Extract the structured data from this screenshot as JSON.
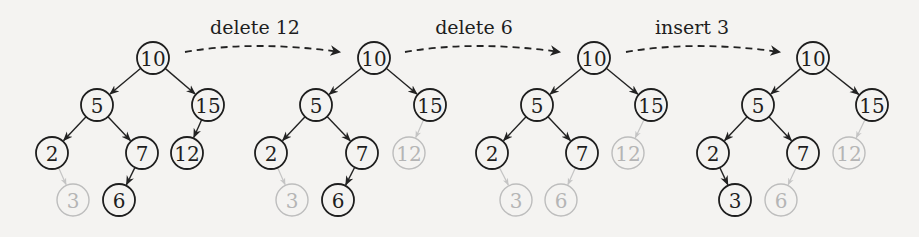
{
  "colors": {
    "active": "#1e1e1e",
    "ghost": "#bdbdbd",
    "background": "#f4f3f1"
  },
  "transitions": [
    {
      "label": "delete 12"
    },
    {
      "label": "delete 6"
    },
    {
      "label": "insert 3"
    }
  ],
  "trees": [
    {
      "name": "initial",
      "nodes": [
        {
          "key": "10",
          "x": 153,
          "y": 58,
          "state": "active"
        },
        {
          "key": "5",
          "x": 97,
          "y": 105,
          "state": "active"
        },
        {
          "key": "15",
          "x": 208,
          "y": 105,
          "state": "active"
        },
        {
          "key": "2",
          "x": 52,
          "y": 153,
          "state": "active"
        },
        {
          "key": "7",
          "x": 142,
          "y": 153,
          "state": "active"
        },
        {
          "key": "12",
          "x": 187,
          "y": 153,
          "state": "active"
        },
        {
          "key": "3",
          "x": 73,
          "y": 200,
          "state": "ghost"
        },
        {
          "key": "6",
          "x": 119,
          "y": 200,
          "state": "active"
        }
      ]
    },
    {
      "name": "after-delete-12",
      "nodes": [
        {
          "key": "10",
          "x": 374,
          "y": 58,
          "state": "active"
        },
        {
          "key": "5",
          "x": 316,
          "y": 105,
          "state": "active"
        },
        {
          "key": "15",
          "x": 430,
          "y": 105,
          "state": "active"
        },
        {
          "key": "2",
          "x": 271,
          "y": 153,
          "state": "active"
        },
        {
          "key": "7",
          "x": 362,
          "y": 153,
          "state": "active"
        },
        {
          "key": "12",
          "x": 409,
          "y": 153,
          "state": "ghost"
        },
        {
          "key": "3",
          "x": 292,
          "y": 200,
          "state": "ghost"
        },
        {
          "key": "6",
          "x": 338,
          "y": 200,
          "state": "active"
        }
      ]
    },
    {
      "name": "after-delete-6",
      "nodes": [
        {
          "key": "10",
          "x": 594,
          "y": 58,
          "state": "active"
        },
        {
          "key": "5",
          "x": 537,
          "y": 105,
          "state": "active"
        },
        {
          "key": "15",
          "x": 651,
          "y": 105,
          "state": "active"
        },
        {
          "key": "2",
          "x": 492,
          "y": 153,
          "state": "active"
        },
        {
          "key": "7",
          "x": 582,
          "y": 153,
          "state": "active"
        },
        {
          "key": "12",
          "x": 628,
          "y": 153,
          "state": "ghost"
        },
        {
          "key": "3",
          "x": 516,
          "y": 200,
          "state": "ghost"
        },
        {
          "key": "6",
          "x": 561,
          "y": 200,
          "state": "ghost"
        }
      ]
    },
    {
      "name": "after-insert-3",
      "nodes": [
        {
          "key": "10",
          "x": 813,
          "y": 58,
          "state": "active"
        },
        {
          "key": "5",
          "x": 758,
          "y": 105,
          "state": "active"
        },
        {
          "key": "15",
          "x": 872,
          "y": 105,
          "state": "active"
        },
        {
          "key": "2",
          "x": 713,
          "y": 153,
          "state": "active"
        },
        {
          "key": "7",
          "x": 803,
          "y": 153,
          "state": "active"
        },
        {
          "key": "12",
          "x": 849,
          "y": 153,
          "state": "ghost"
        },
        {
          "key": "3",
          "x": 735,
          "y": 200,
          "state": "active"
        },
        {
          "key": "6",
          "x": 781,
          "y": 200,
          "state": "ghost"
        }
      ]
    }
  ]
}
